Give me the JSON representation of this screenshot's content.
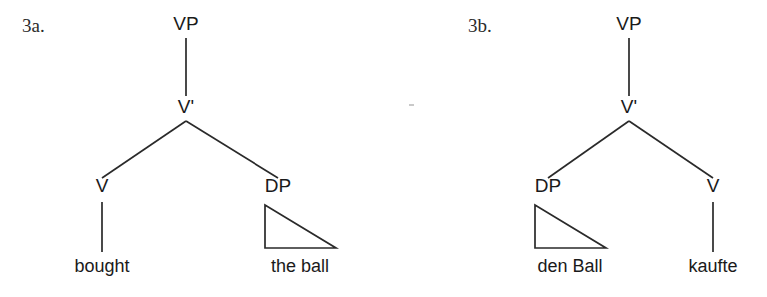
{
  "figure": {
    "background_color": "#ffffff",
    "line_color": "#2a2a2a",
    "text_color": "#1a1a1a"
  },
  "trees": [
    {
      "id": "3a",
      "number_label": "3a.",
      "language": "English",
      "root": {
        "label": "VP",
        "x": 186,
        "y": 30
      },
      "bar_node": {
        "label": "V'",
        "x": 186,
        "y": 113
      },
      "children": [
        {
          "label": "V",
          "x": 102,
          "y": 192,
          "type": "head",
          "terminal": "bought",
          "terminal_x": 102,
          "terminal_y": 272,
          "has_triangle": false
        },
        {
          "label": "DP",
          "x": 278,
          "y": 192,
          "type": "complement",
          "terminal": "the ball",
          "terminal_x": 300,
          "terminal_y": 272,
          "has_triangle": true,
          "triangle": {
            "apex_x": 265,
            "apex_y": 205,
            "base_y": 248,
            "right_x": 336
          }
        }
      ]
    },
    {
      "id": "3b",
      "number_label": "3b.",
      "language": "German",
      "root": {
        "label": "VP",
        "x": 629,
        "y": 30
      },
      "bar_node": {
        "label": "V'",
        "x": 629,
        "y": 113
      },
      "children": [
        {
          "label": "DP",
          "x": 548,
          "y": 192,
          "type": "complement",
          "terminal": "den Ball",
          "terminal_x": 570,
          "terminal_y": 272,
          "has_triangle": true,
          "triangle": {
            "apex_x": 535,
            "apex_y": 205,
            "base_y": 248,
            "right_x": 606
          }
        },
        {
          "label": "V",
          "x": 713,
          "y": 192,
          "type": "head",
          "terminal": "kaufte",
          "terminal_x": 713,
          "terminal_y": 272,
          "has_triangle": false
        }
      ]
    }
  ],
  "labels": {
    "tree_a_number": "3a.",
    "tree_a_root": "VP",
    "tree_a_bar": "V'",
    "tree_a_left_node": "V",
    "tree_a_right_node": "DP",
    "tree_a_left_terminal": "bought",
    "tree_a_right_terminal": "the ball",
    "tree_b_number": "3b.",
    "tree_b_root": "VP",
    "tree_b_bar": "V'",
    "tree_b_left_node": "DP",
    "tree_b_right_node": "V",
    "tree_b_left_terminal": "den Ball",
    "tree_b_right_terminal": "kaufte"
  }
}
